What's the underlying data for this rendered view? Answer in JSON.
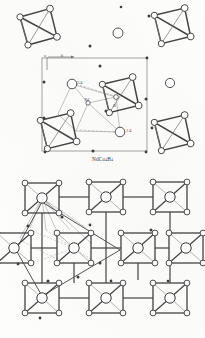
{
  "figure": {
    "background_color": "#fdfdfc",
    "ink_color": "#3a3a3a",
    "type": "crystal-structure-projection"
  },
  "panels": [
    {
      "id": "top",
      "caption_main": "NdCo",
      "caption_sub1": "4",
      "caption_mid": "B",
      "caption_sub2": "4",
      "caption_plain": "NdCo4B4",
      "axis_labels": [
        {
          "name": "a-axis-label",
          "text": "a"
        },
        {
          "name": "b-axis-label",
          "text": "b"
        }
      ],
      "height_labels": [
        {
          "name": "height-label-three-quarter",
          "text": "3/4"
        },
        {
          "name": "height-label-one-quarter",
          "text": "1/4"
        }
      ],
      "site_labels": [
        {
          "name": "site-label-nd",
          "text": "Nd"
        },
        {
          "name": "site-label-b",
          "text": "B"
        }
      ],
      "clusters": [
        {
          "name": "cluster-top-left",
          "cx": 38,
          "cy": 27,
          "r": 19,
          "rot": -10,
          "style": "tetra"
        },
        {
          "name": "cluster-top-right",
          "cx": 172,
          "cy": 26,
          "r": 19,
          "rot": -8,
          "style": "tetra"
        },
        {
          "name": "cluster-cell-upper",
          "cx": 120,
          "cy": 95,
          "r": 19,
          "rot": -8,
          "style": "tetra"
        },
        {
          "name": "cluster-cell-lower",
          "cx": 58,
          "cy": 131,
          "r": 19,
          "rot": -8,
          "style": "tetra"
        },
        {
          "name": "cluster-mid-right",
          "cx": 172,
          "cy": 133,
          "r": 19,
          "rot": -8,
          "style": "tetra"
        }
      ],
      "big_atoms": [
        {
          "name": "atom-nd-isolated-upper",
          "cx": 118,
          "cy": 33,
          "r": 5.0
        },
        {
          "name": "atom-nd-isolated-right",
          "cx": 170,
          "cy": 83,
          "r": 4.6
        },
        {
          "name": "atom-nd-three-quarter",
          "cx": 72,
          "cy": 84,
          "r": 4.8
        },
        {
          "name": "atom-nd-one-quarter",
          "cx": 120,
          "cy": 132,
          "r": 4.8
        }
      ],
      "unit_cell": {
        "name": "unit-cell-box",
        "x": 42,
        "y": 58,
        "w": 105,
        "h": 93
      }
    },
    {
      "id": "bottom",
      "caption_main": "CeCo",
      "caption_sub1": "4",
      "caption_mid": "B",
      "caption_sub2": "4",
      "caption_plain": "CeCo4B4",
      "axis_labels": [
        {
          "name": "a-axis-label",
          "text": "a"
        },
        {
          "name": "b-axis-label",
          "text": "b"
        }
      ],
      "site_labels": [
        {
          "name": "site-label-ce",
          "text": "Ce"
        },
        {
          "name": "site-label-b",
          "text": "B"
        }
      ],
      "clusters": [
        {
          "name": "cluster-r0-c0",
          "cx": 42,
          "cy": 30,
          "r": 17
        },
        {
          "name": "cluster-r0-c1",
          "cx": 106,
          "cy": 29,
          "r": 17
        },
        {
          "name": "cluster-r0-c2",
          "cx": 170,
          "cy": 29,
          "r": 17
        },
        {
          "name": "cluster-r1-cL",
          "cx": 14,
          "cy": 80,
          "r": 17
        },
        {
          "name": "cluster-r1-c0",
          "cx": 74,
          "cy": 80,
          "r": 17
        },
        {
          "name": "cluster-r1-c1",
          "cx": 138,
          "cy": 80,
          "r": 17
        },
        {
          "name": "cluster-r1-c2",
          "cx": 186,
          "cy": 80,
          "r": 17
        },
        {
          "name": "cluster-r2-c0",
          "cx": 42,
          "cy": 130,
          "r": 17
        },
        {
          "name": "cluster-r2-c1",
          "cx": 106,
          "cy": 130,
          "r": 17
        },
        {
          "name": "cluster-r2-c2",
          "cx": 170,
          "cy": 130,
          "r": 17
        }
      ]
    }
  ]
}
